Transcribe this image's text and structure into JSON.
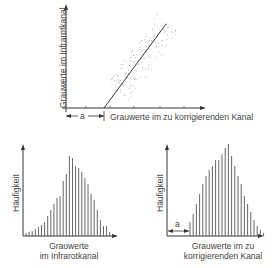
{
  "scatter_plot": {
    "y_axis_label": "Grauwerte im Infrarotkanal",
    "x_axis_label": "Grauwerte im zu korrigierenden Kanal",
    "offset_label": "a"
  },
  "histogram_left": {
    "y_axis_label": "Häufigkeit",
    "x_axis_label_line1": "Grauwerte",
    "x_axis_label_line2": "im Infrarotkanal",
    "bar_heights": [
      3,
      4,
      5,
      7,
      9,
      11,
      14,
      20,
      26,
      32,
      38,
      40,
      55,
      62,
      80,
      78,
      70,
      68,
      64,
      58,
      52,
      42,
      36,
      26,
      16,
      10,
      10,
      4,
      2,
      1
    ]
  },
  "histogram_right": {
    "y_axis_label": "Häufigkeit",
    "x_axis_label_line1": "Grauwerte im zu",
    "x_axis_label_line2": "korrigierenden Kanal",
    "offset_label": "a",
    "bar_heights": [
      14,
      22,
      32,
      42,
      52,
      60,
      66,
      70,
      76,
      76,
      82,
      88,
      92,
      80,
      70,
      60,
      52,
      40,
      32,
      24,
      16,
      10,
      6,
      3
    ]
  },
  "colors": {
    "line": "#333333",
    "bar": "#555555",
    "text": "#444444"
  }
}
